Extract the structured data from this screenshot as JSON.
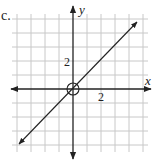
{
  "panel_label": "c.",
  "axes": {
    "x_label": "x",
    "y_label": "y",
    "x_tick_label": "2",
    "y_tick_label": "2"
  },
  "grid": {
    "x_min": -4,
    "x_max": 5,
    "y_min": -4,
    "y_max": 5,
    "unit_px": 14
  },
  "graph": {
    "equation": "y = x",
    "slope": 1,
    "intercept": 0,
    "open_circle_at": [
      0,
      0
    ]
  },
  "colors": {
    "grid": "#c8c8c8",
    "axis": "#222222",
    "line": "#222222"
  }
}
